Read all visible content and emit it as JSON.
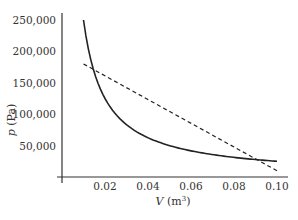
{
  "chart_data": {
    "type": "line",
    "title": "",
    "xlabel": "V (m³)",
    "xlabel_var": "V",
    "xlabel_unit": "(m",
    "xlabel_sup": "3",
    "xlabel_close": ")",
    "ylabel": "p (Pa)",
    "ylabel_var": "p",
    "ylabel_unit": " (Pa)",
    "xlim": [
      0,
      0.1
    ],
    "ylim": [
      0,
      250000
    ],
    "x_ticks": [
      0.02,
      0.04,
      0.06,
      0.08,
      0.1
    ],
    "x_tick_labels": [
      "0.02",
      "0.04",
      "0.06",
      "0.08",
      "0.10"
    ],
    "y_ticks": [
      50000,
      100000,
      150000,
      200000,
      250000
    ],
    "y_tick_labels": [
      "50,000",
      "100,000",
      "150,000",
      "200,000",
      "250,000"
    ],
    "grid": false,
    "legend": null,
    "series": [
      {
        "name": "isotherm p = k/V",
        "style": "solid",
        "color": "#222222",
        "x": [
          0.01,
          0.0125,
          0.015,
          0.02,
          0.025,
          0.03,
          0.04,
          0.05,
          0.06,
          0.07,
          0.08,
          0.09,
          0.1
        ],
        "y": [
          250000,
          200000,
          166667,
          125000,
          100000,
          83333,
          62500,
          50000,
          41667,
          35714,
          31250,
          27778,
          25000
        ]
      },
      {
        "name": "straight-line path",
        "style": "dashed",
        "color": "#222222",
        "x": [
          0.01,
          0.1
        ],
        "y": [
          180000,
          10000
        ]
      }
    ]
  }
}
